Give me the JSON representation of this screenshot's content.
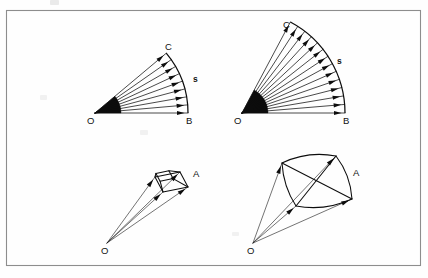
{
  "figure": {
    "background_color": "#fefefe",
    "frame_color": "#8d8d8d",
    "ink_color": "#0d0d0d",
    "frame": {
      "x": 6,
      "y": 10,
      "width": 414,
      "height": 255
    }
  },
  "panels": [
    {
      "id": "top-left",
      "name": "plane-angle-narrow",
      "apex": {
        "label": "O",
        "x": 95,
        "y": 113
      },
      "arc_end_bottom": {
        "label": "B",
        "x": 188,
        "y": 113
      },
      "arc_end_top": {
        "label": "C",
        "x": 170,
        "y": 54
      },
      "arc_label": {
        "label": "s",
        "x": 193,
        "y": 82
      },
      "ray_count": 9,
      "radius": 93,
      "angle_start_deg": 0,
      "angle_span_deg": 40,
      "wedge_filled": true
    },
    {
      "id": "top-right",
      "name": "plane-angle-wide",
      "apex": {
        "label": "O",
        "x": 242,
        "y": 113
      },
      "arc_end_bottom": {
        "label": "B",
        "x": 345,
        "y": 113
      },
      "arc_end_top": {
        "label": "C",
        "x": 288,
        "y": 32
      },
      "arc_label": {
        "label": "s",
        "x": 337,
        "y": 64
      },
      "ray_count": 14,
      "radius": 103,
      "angle_start_deg": 0,
      "angle_span_deg": 62,
      "wedge_filled": true
    },
    {
      "id": "bottom-left",
      "name": "solid-angle-narrow",
      "apex": {
        "label": "O",
        "x": 107,
        "y": 243
      },
      "patch_label": {
        "label": "A",
        "x": 193,
        "y": 177
      },
      "patch_corners": [
        {
          "x": 155,
          "y": 177
        },
        {
          "x": 180,
          "y": 172
        },
        {
          "x": 188,
          "y": 187
        },
        {
          "x": 163,
          "y": 192
        }
      ],
      "patch_depth": {
        "dx": 0,
        "dy": 0
      },
      "ray_count": 4,
      "patch_curved": false
    },
    {
      "id": "bottom-right",
      "name": "solid-angle-wide",
      "apex": {
        "label": "O",
        "x": 253,
        "y": 243
      },
      "patch_label": {
        "label": "A",
        "x": 353,
        "y": 176
      },
      "patch_corners": [
        {
          "x": 282,
          "y": 163
        },
        {
          "x": 336,
          "y": 156
        },
        {
          "x": 352,
          "y": 199
        },
        {
          "x": 296,
          "y": 206
        }
      ],
      "ray_count": 4,
      "patch_curved": true
    }
  ],
  "labels": {
    "O": "O",
    "A": "A",
    "B": "B",
    "C": "C",
    "s": "s"
  },
  "artifacts": [
    {
      "name": "scan-smudge-top",
      "x": 50,
      "y": 0,
      "width": 9,
      "height": 5
    },
    {
      "name": "scan-smudge-left",
      "x": 40,
      "y": 95,
      "width": 7,
      "height": 5
    },
    {
      "name": "scan-smudge-mid",
      "x": 140,
      "y": 130,
      "width": 8,
      "height": 5
    }
  ]
}
